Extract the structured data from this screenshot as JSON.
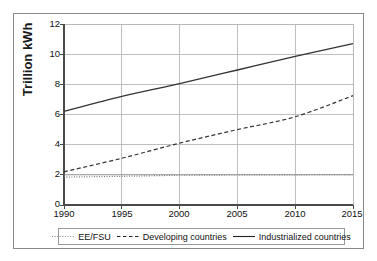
{
  "chart_data": {
    "type": "line",
    "title": "",
    "subtitle": "",
    "xlabel": "",
    "ylabel": "Trillion kWh",
    "xlim": [
      1990,
      2015
    ],
    "ylim": [
      0,
      12
    ],
    "grid": true,
    "grid_style": "horizontal-and-vertical",
    "legend_position": "bottom",
    "x_ticks": [
      "1990",
      "1995",
      "2000",
      "2005",
      "2010",
      "2015"
    ],
    "x_tick_values": [
      1990,
      1995,
      2000,
      2005,
      2010,
      2015
    ],
    "y_ticks": [
      "0",
      "2",
      "4",
      "6",
      "8",
      "10",
      "12"
    ],
    "y_tick_values": [
      0,
      2,
      4,
      6,
      8,
      10,
      12
    ],
    "x": [
      1990,
      1995,
      2000,
      2005,
      2010,
      2015
    ],
    "series": [
      {
        "name": "EE/FSU",
        "style": "dotted",
        "color": "#7a7a7a",
        "values": [
          1.85,
          1.9,
          1.97,
          1.99,
          2.0,
          2.02
        ]
      },
      {
        "name": "Developing countries",
        "style": "dashed",
        "color": "#333333",
        "values": [
          2.2,
          3.1,
          4.1,
          5.0,
          5.85,
          7.25
        ]
      },
      {
        "name": "Industrialized countries",
        "style": "solid",
        "color": "#333333",
        "values": [
          6.2,
          7.2,
          8.05,
          8.95,
          9.85,
          10.7
        ]
      }
    ]
  },
  "legend": {
    "items": [
      {
        "label": "EE/FSU",
        "key": "dotted-line-key"
      },
      {
        "label": "Developing countries",
        "key": "dashed-line-key"
      },
      {
        "label": "Industrialized countries",
        "key": "solid-line-key"
      }
    ]
  },
  "colors": {
    "frame": "#8a8a8a",
    "grid": "#b8b8b8",
    "axis": "#555555",
    "text": "#111111"
  }
}
